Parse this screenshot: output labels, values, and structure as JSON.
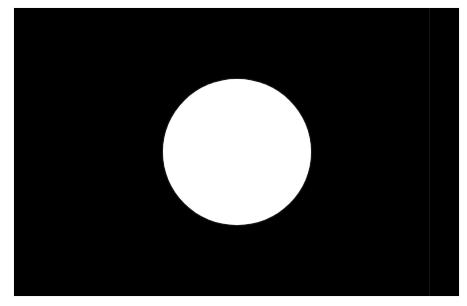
{
  "image": {
    "description": "White circular disc centered on a black rectangular field",
    "background_color": "#ffffff",
    "field": {
      "color": "#000000",
      "shape": "rectangle"
    },
    "disc": {
      "color": "#ffffff",
      "shape": "circle"
    }
  }
}
